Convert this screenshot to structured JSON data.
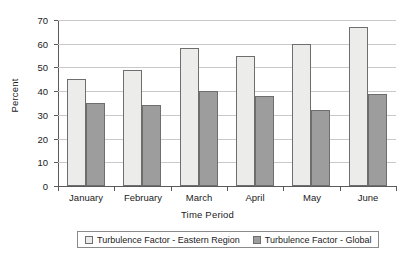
{
  "chart_data": {
    "type": "bar",
    "title": "",
    "xlabel": "Time Period",
    "ylabel": "Percent",
    "categories": [
      "January",
      "February",
      "March",
      "April",
      "May",
      "June"
    ],
    "series": [
      {
        "name": "Turbulence Factor - Eastern Region",
        "color": "#ececea",
        "values": [
          45,
          49,
          58,
          55,
          60,
          67
        ]
      },
      {
        "name": "Turbulence Factor - Global",
        "color": "#9d9d9d",
        "values": [
          35,
          34,
          40,
          38,
          32,
          39
        ]
      }
    ],
    "ylim": [
      0,
      70
    ],
    "ytick_step": 10,
    "yticks": [
      0,
      10,
      20,
      30,
      40,
      50,
      60,
      70
    ],
    "ytick_labels": [
      "0",
      "10",
      "20",
      "30",
      "40",
      "50",
      "60",
      "70"
    ],
    "grid": true,
    "legend_position": "bottom",
    "bar_border_color": "#6e6e6e",
    "axis_color": "#5a5a5a",
    "gridline_color": "#c9c9c9"
  }
}
